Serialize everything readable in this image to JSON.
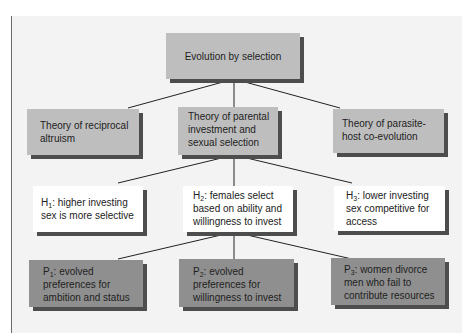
{
  "diagram": {
    "root": {
      "label": "Evolution by selection"
    },
    "theories": [
      {
        "label": "Theory of reciprocal altruism"
      },
      {
        "label": "Theory of parental investment and sexual selection"
      },
      {
        "label": "Theory of parasite-host co-evolution"
      }
    ],
    "hypotheses": [
      {
        "prefix": "H",
        "sub": "1",
        "label": ": higher investing sex is more selective"
      },
      {
        "prefix": "H",
        "sub": "2",
        "label": ": females select based on ability and willingness to invest"
      },
      {
        "prefix": "H",
        "sub": "3",
        "label": ": lower investing sex competitive for access"
      }
    ],
    "predictions": [
      {
        "prefix": "P",
        "sub": "1",
        "label": ": evolved preferences for ambition and status"
      },
      {
        "prefix": "P",
        "sub": "2",
        "label": ": evolved preferences for willingness to invest"
      },
      {
        "prefix": "P",
        "sub": "3",
        "label": ": women divorce men who fail to contribute resources"
      }
    ],
    "colors": {
      "background": "#f3f3f3",
      "theory_box": "#bebebe",
      "hypothesis_box": "#ffffff",
      "prediction_box": "#8f8f8f",
      "shadow": "#4d4d4d",
      "line": "#222222"
    }
  }
}
